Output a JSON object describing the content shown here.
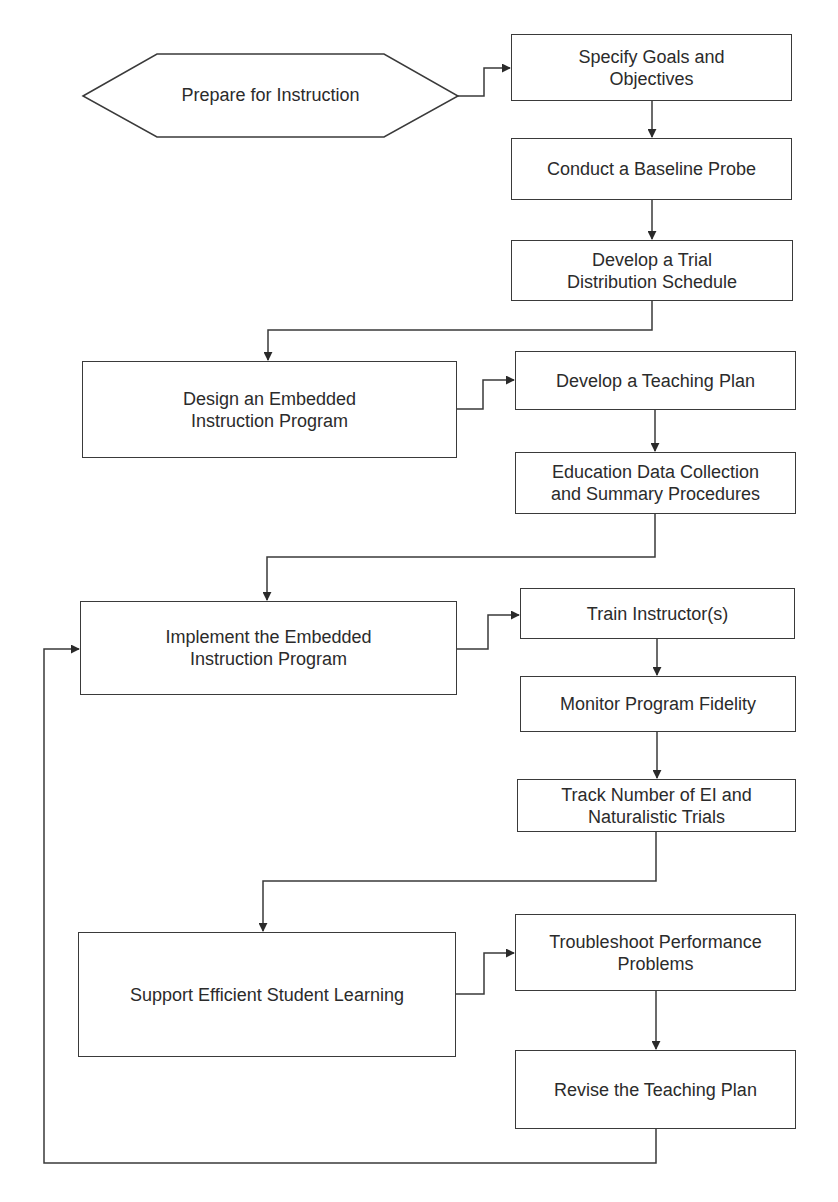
{
  "diagram": {
    "type": "flowchart",
    "start": {
      "id": "prepare",
      "label": "Prepare for Instruction",
      "shape": "hexagon"
    },
    "phases": [
      {
        "id": "design",
        "label": "Design an Embedded\nInstruction Program",
        "steps": [
          {
            "id": "teaching-plan",
            "label": "Develop a Teaching Plan"
          },
          {
            "id": "data-collection",
            "label": "Education Data Collection\nand Summary Procedures"
          }
        ]
      },
      {
        "id": "implement",
        "label": "Implement the Embedded\nInstruction Program",
        "steps": [
          {
            "id": "train",
            "label": "Train Instructor(s)"
          },
          {
            "id": "fidelity",
            "label": "Monitor Program Fidelity"
          },
          {
            "id": "track",
            "label": "Track Number of EI and\nNaturalistic Trials"
          }
        ]
      },
      {
        "id": "support",
        "label": "Support Efficient Student Learning",
        "steps": [
          {
            "id": "troubleshoot",
            "label": "Troubleshoot Performance\nProblems"
          },
          {
            "id": "revise",
            "label": "Revise the Teaching Plan"
          }
        ]
      }
    ],
    "prepare_steps": [
      {
        "id": "goals",
        "label": "Specify Goals and\nObjectives"
      },
      {
        "id": "baseline",
        "label": "Conduct a Baseline Probe"
      },
      {
        "id": "trial-schedule",
        "label": "Develop a Trial\nDistribution Schedule"
      }
    ],
    "edges": [
      [
        "prepare",
        "goals"
      ],
      [
        "goals",
        "baseline"
      ],
      [
        "baseline",
        "trial-schedule"
      ],
      [
        "trial-schedule",
        "design"
      ],
      [
        "design",
        "teaching-plan"
      ],
      [
        "teaching-plan",
        "data-collection"
      ],
      [
        "data-collection",
        "implement"
      ],
      [
        "implement",
        "train"
      ],
      [
        "train",
        "fidelity"
      ],
      [
        "fidelity",
        "track"
      ],
      [
        "track",
        "support"
      ],
      [
        "support",
        "troubleshoot"
      ],
      [
        "troubleshoot",
        "revise"
      ],
      [
        "revise",
        "implement"
      ]
    ],
    "colors": {
      "stroke": "#3a3a3a",
      "fill": "#ffffff",
      "text": "#2b2b2b"
    }
  }
}
